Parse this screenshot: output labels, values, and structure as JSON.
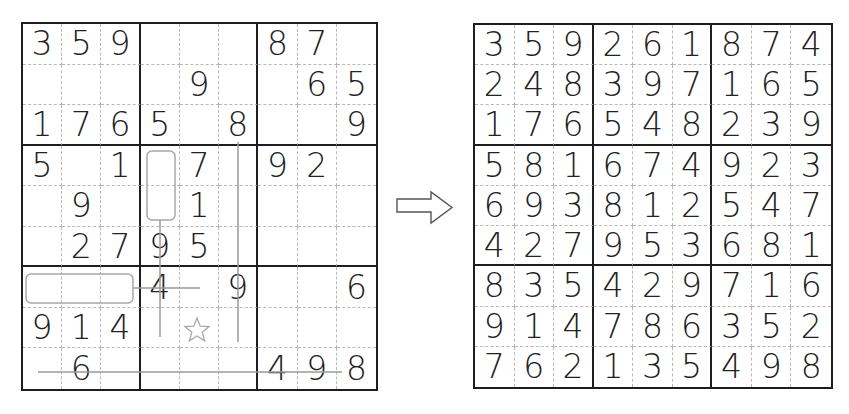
{
  "puzzle": {
    "title": "Sudoku puzzle",
    "rows": [
      [
        "3",
        "5",
        "9",
        "",
        "",
        "",
        "8",
        "7",
        ""
      ],
      [
        "",
        "",
        "",
        "",
        "9",
        "",
        "",
        "6",
        "5"
      ],
      [
        "1",
        "7",
        "6",
        "5",
        "",
        "8",
        "",
        "",
        "9"
      ],
      [
        "5",
        "",
        "1",
        "",
        "7",
        "",
        "9",
        "2",
        ""
      ],
      [
        "",
        "9",
        "",
        "",
        "1",
        "",
        "",
        "",
        ""
      ],
      [
        "",
        "2",
        "7",
        "9",
        "5",
        "",
        "",
        "",
        ""
      ],
      [
        "",
        "",
        "",
        "4",
        "",
        "9",
        "",
        "",
        "6"
      ],
      [
        "9",
        "1",
        "4",
        "",
        "",
        "",
        "",
        "",
        ""
      ],
      [
        "",
        "6",
        "",
        "",
        "",
        "",
        "4",
        "9",
        "8"
      ]
    ],
    "annotations": {
      "cage_vertical": {
        "col": 3,
        "rows": [
          3,
          4
        ],
        "shape": "rounded-rect"
      },
      "cage_horizontal": {
        "row": 6,
        "cols": [
          0,
          1,
          2
        ],
        "shape": "rounded-rect"
      },
      "star": {
        "row": 7,
        "col": 4,
        "icon": "star-outline-icon"
      },
      "lines": [
        {
          "desc": "vertical line col 3 from cage down to row 7"
        },
        {
          "desc": "vertical line col 5 from row 2 to row 7"
        },
        {
          "desc": "horizontal line row 6 from cage to col 4"
        },
        {
          "desc": "horizontal line row 8 across cols 0-8"
        }
      ],
      "line_color": "#9a9a9a"
    }
  },
  "arrow": {
    "icon": "right-arrow-outline-icon"
  },
  "solution": {
    "title": "Sudoku solution",
    "rows": [
      [
        "3",
        "5",
        "9",
        "2",
        "6",
        "1",
        "8",
        "7",
        "4"
      ],
      [
        "2",
        "4",
        "8",
        "3",
        "9",
        "7",
        "1",
        "6",
        "5"
      ],
      [
        "1",
        "7",
        "6",
        "5",
        "4",
        "8",
        "2",
        "3",
        "9"
      ],
      [
        "5",
        "8",
        "1",
        "6",
        "7",
        "4",
        "9",
        "2",
        "3"
      ],
      [
        "6",
        "9",
        "3",
        "8",
        "1",
        "2",
        "5",
        "4",
        "7"
      ],
      [
        "4",
        "2",
        "7",
        "9",
        "5",
        "3",
        "6",
        "8",
        "1"
      ],
      [
        "8",
        "3",
        "5",
        "4",
        "2",
        "9",
        "7",
        "1",
        "6"
      ],
      [
        "9",
        "1",
        "4",
        "7",
        "8",
        "6",
        "3",
        "5",
        "2"
      ],
      [
        "7",
        "6",
        "2",
        "1",
        "3",
        "5",
        "4",
        "9",
        "8"
      ]
    ]
  },
  "colors": {
    "grid_line": "#1e1e1e",
    "minor_line": "#b8b8b8",
    "digit": "#222222",
    "annotation": "#9a9a9a"
  }
}
